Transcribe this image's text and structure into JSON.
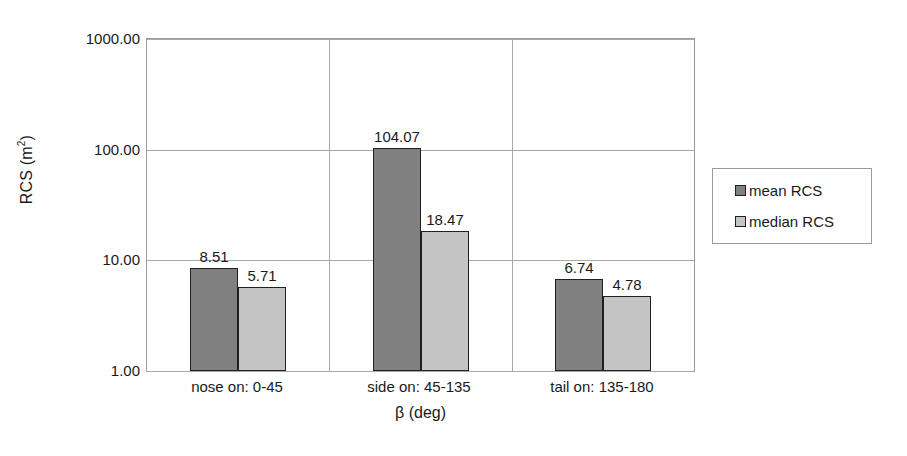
{
  "chart_data": {
    "type": "bar",
    "title": "",
    "subtitle": "",
    "xlabel": "β (deg)",
    "ylabel": "RCS (m²)",
    "ylabel_base": "RCS (m",
    "ylabel_sup": "2",
    "ylabel_close": ")",
    "yscale": "log",
    "ylim": [
      1.0,
      1000.0
    ],
    "ytick_labels": [
      "1000.00",
      "100.00",
      "10.00",
      "1.00"
    ],
    "ytick_values": [
      1000.0,
      100.0,
      10.0,
      1.0
    ],
    "grid": "horizontal-and-category-separators",
    "legend_position": "right-outside",
    "categories": [
      "nose on:  0-45",
      "side on: 45-135",
      "tail on: 135-180"
    ],
    "series": [
      {
        "name": "mean RCS",
        "color": "#808080",
        "values": [
          8.51,
          104.07,
          6.74
        ],
        "labels": [
          "8.51",
          "104.07",
          "6.74"
        ]
      },
      {
        "name": "median RCS",
        "color": "#c4c4c4",
        "values": [
          5.71,
          18.47,
          4.78
        ],
        "labels": [
          "5.71",
          "18.47",
          "4.78"
        ]
      }
    ]
  },
  "legend": {
    "items": [
      {
        "label": "mean RCS",
        "swatch": "#808080"
      },
      {
        "label": "median RCS",
        "swatch": "#c4c4c4"
      }
    ]
  },
  "colors": {
    "mean_bar": "#808080",
    "median_bar": "#c4c4c4",
    "bar_outline": "#202020",
    "gridline": "#a8a8a8",
    "plot_border": "#9a9a9a",
    "text": "#1a1a1a",
    "background": "#ffffff"
  }
}
